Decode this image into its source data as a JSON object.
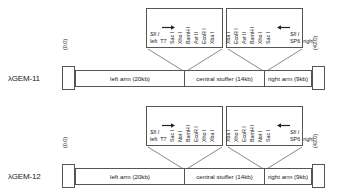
{
  "panels": [
    {
      "id": "gem11",
      "vector_name": "λGEM-11",
      "coords": {
        "left": "(0.0)",
        "right": "(43.0)"
      },
      "segments": [
        {
          "label": "left arm (20kb)"
        },
        {
          "label": "central stuffer (14kb)"
        },
        {
          "label": "right arm (9kb)"
        }
      ],
      "callouts": [
        {
          "id": "gem11-left-polylinker",
          "terminal": {
            "enzyme": "Sfi I",
            "arrow": "right",
            "side_label": "left",
            "promoter": "T7"
          },
          "enzymes": [
            "Sac I",
            "Xho I",
            "BamH I",
            "Avr II",
            "EcoR I",
            "Xba I"
          ]
        },
        {
          "id": "gem11-right-polylinker",
          "enzymes": [
            "Xba I",
            "EcoR I",
            "Avr II",
            "BamH I",
            "Xho I",
            "Sac I"
          ],
          "terminal": {
            "enzyme": "Sfi I",
            "arrow": "left",
            "side_label": "right",
            "promoter": "SP6"
          }
        }
      ]
    },
    {
      "id": "gem12",
      "vector_name": "λGEM-12",
      "coords": {
        "left": "(0.0)",
        "right": "(43.0)"
      },
      "segments": [
        {
          "label": "left arm (20kb)"
        },
        {
          "label": "central stuffer (14kb)"
        },
        {
          "label": "right arm (9kb)"
        }
      ],
      "callouts": [
        {
          "id": "gem12-left-polylinker",
          "terminal": {
            "enzyme": "Sfi I",
            "arrow": "right",
            "side_label": "left",
            "promoter": "T7"
          },
          "enzymes": [
            "Sac I",
            "Not I",
            "BamH I",
            "EcoR I",
            "Xho I",
            "Xba I"
          ]
        },
        {
          "id": "gem12-right-polylinker",
          "enzymes": [
            "Xba I",
            "Xho I",
            "EcoR I",
            "BamH I",
            "Not I",
            "Sac I"
          ],
          "terminal": {
            "enzyme": "Sfi I",
            "arrow": "left",
            "side_label": "right",
            "promoter": "SP6"
          }
        }
      ]
    }
  ],
  "colors": {
    "stroke": "#555555",
    "text": "#1a1a1a",
    "background": "#ffffff"
  }
}
